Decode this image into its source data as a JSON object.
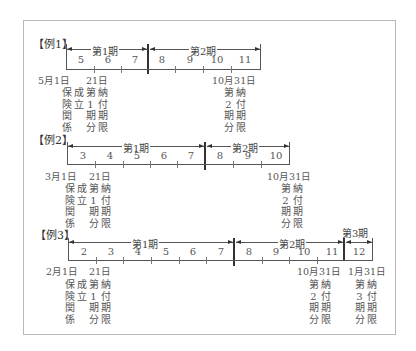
{
  "examples": [
    {
      "label": "【例1】",
      "months": [
        "5",
        "6",
        "7",
        "8",
        "9",
        "10",
        "11"
      ],
      "periods": [
        "第1期",
        "第2期"
      ],
      "start_date": "5月1日",
      "notes": {
        "col1": [
          "保",
          "険",
          "関",
          "係"
        ],
        "col2": [
          "成",
          "立"
        ],
        "due1_date": "21日",
        "due1_col1": [
          "第",
          "1",
          "期",
          "分"
        ],
        "due1_col2": [
          "納",
          "付",
          "期",
          "限"
        ],
        "due2_date": "10月31日",
        "due2_col1": [
          "第",
          "2",
          "期",
          "分"
        ],
        "due2_col2": [
          "納",
          "付",
          "期",
          "限"
        ]
      }
    },
    {
      "label": "【例2】",
      "months": [
        "3",
        "4",
        "5",
        "6",
        "7",
        "8",
        "9",
        "10"
      ],
      "periods": [
        "第1期",
        "第2期"
      ],
      "start_date": "3月1日",
      "notes": {
        "col1": [
          "保",
          "険",
          "関",
          "係"
        ],
        "col2": [
          "成",
          "立"
        ],
        "due1_date": "21日",
        "due1_col1": [
          "第",
          "1",
          "期",
          "分"
        ],
        "due1_col2": [
          "納",
          "付",
          "期",
          "限"
        ],
        "due2_date": "10月31日",
        "due2_col1": [
          "第",
          "2",
          "期",
          "分"
        ],
        "due2_col2": [
          "納",
          "付",
          "期",
          "限"
        ]
      }
    },
    {
      "label": "【例3】",
      "months": [
        "2",
        "3",
        "4",
        "5",
        "6",
        "7",
        "8",
        "9",
        "10",
        "11",
        "12"
      ],
      "periods": [
        "第1期",
        "第2期",
        "第3期"
      ],
      "start_date": "2月1日",
      "notes": {
        "col1": [
          "保",
          "険",
          "関",
          "係"
        ],
        "col2": [
          "成",
          "立"
        ],
        "due1_date": "21日",
        "due1_col1": [
          "第",
          "1",
          "期",
          "分"
        ],
        "due1_col2": [
          "納",
          "付",
          "期",
          "限"
        ],
        "due2_date": "10月31日",
        "due2_col1": [
          "第",
          "2",
          "期",
          "分"
        ],
        "due2_col2": [
          "納",
          "付",
          "期",
          "限"
        ],
        "due3_date": "1月31日",
        "due3_col1": [
          "第",
          "3",
          "期",
          "分"
        ],
        "due3_col2": [
          "納",
          "付",
          "期",
          "限"
        ]
      }
    }
  ]
}
